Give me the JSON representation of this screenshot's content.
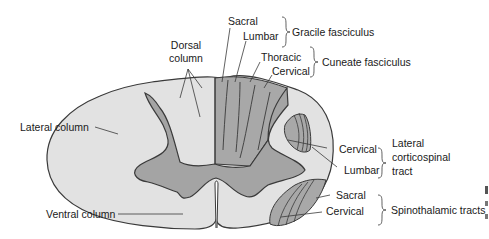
{
  "diagram": {
    "type": "spinal cord cross-section",
    "colors": {
      "white_matter": "#e2e2e2",
      "gray_matter": "#a4a4a4",
      "tract_fill": "#a8a8a8",
      "outline": "#3a3a3a",
      "text": "#1a1a1a"
    },
    "labels": {
      "dorsal_column_1": "Dorsal",
      "dorsal_column_2": "column",
      "lateral_column": "Lateral column",
      "ventral_column": "Ventral column",
      "sacral_top": "Sacral",
      "lumbar_top": "Lumbar",
      "gracile": "Gracile fasciculus",
      "thoracic": "Thoracic",
      "cervical_top": "Cervical",
      "cuneate": "Cuneate fasciculus",
      "cs_cervical": "Cervical",
      "cs_lumbar": "Lumbar",
      "lcs_1": "Lateral",
      "lcs_2": "corticospinal",
      "lcs_3": "tract",
      "st_sacral": "Sacral",
      "st_cervical": "Cervical",
      "spinothalamic": "Spinothalamic tracts"
    }
  }
}
